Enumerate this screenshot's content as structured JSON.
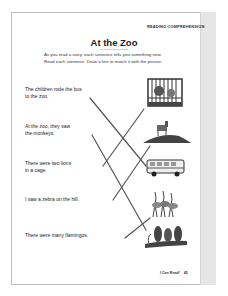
{
  "header": {
    "badge": "READING COMPREHENSION",
    "title": "At the Zoo",
    "instructions_line1": "As you read a story, each sentence tells you something new.",
    "instructions_line2": "Read each sentence. Draw a line to match it with the picture."
  },
  "sentences": [
    {
      "line1": "The children rode the bus",
      "line2": "to the zoo."
    },
    {
      "line1": "At the zoo, they saw",
      "line2": "the monkeys."
    },
    {
      "line1": "There were two lions",
      "line2": "in a cage."
    },
    {
      "line1": "I saw a zebra on the hill.",
      "line2": ""
    },
    {
      "line1": "There were many flamingos.",
      "line2": ""
    }
  ],
  "pictures": [
    {
      "name": "lions-in-cage"
    },
    {
      "name": "zebra-on-hill"
    },
    {
      "name": "school-bus"
    },
    {
      "name": "flamingos"
    },
    {
      "name": "monkeys-on-branch"
    }
  ],
  "footer": {
    "book": "I Can Read!",
    "page_number": "45"
  },
  "colors": {
    "line": "#555555",
    "strip": "#e6e6e6",
    "frame": "#bdbdbd"
  }
}
